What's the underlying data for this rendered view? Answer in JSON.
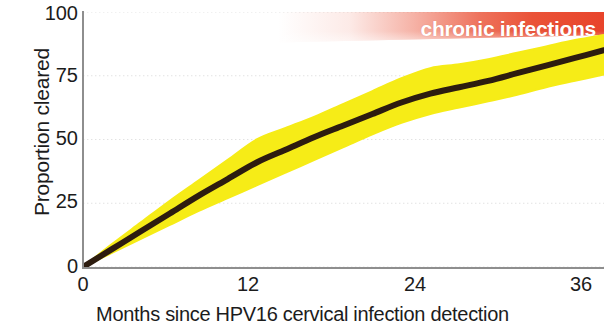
{
  "chart_data": {
    "type": "line",
    "title": "",
    "subtitle": "",
    "xlabel": "Months since HPV16 cervical infection detection",
    "ylabel": "Proportion cleared",
    "xlim": [
      0,
      36
    ],
    "ylim": [
      0,
      100
    ],
    "xticks": [
      0,
      12,
      24,
      36
    ],
    "xtick_labels": [
      "0",
      "12",
      "24",
      "36"
    ],
    "yticks": [
      0,
      25,
      50,
      75,
      100
    ],
    "ytick_labels": [
      "0",
      "25",
      "50",
      "75",
      "100"
    ],
    "grid": "horizontal-dotted",
    "legend": "none",
    "x": [
      0,
      2,
      4,
      6,
      8,
      10,
      12,
      14,
      16,
      18,
      20,
      22,
      24,
      26,
      28,
      30,
      32,
      34,
      36
    ],
    "series": [
      {
        "name": "Proportion cleared (estimate)",
        "color": "#2d1c0f",
        "values": [
          0,
          7,
          14,
          21,
          28,
          34.5,
          41,
          46,
          51,
          55.5,
          60,
          64.5,
          68,
          70.5,
          73,
          76,
          79,
          82,
          85
        ]
      },
      {
        "name": "95% confidence band upper",
        "color": "#f6ec17",
        "values": [
          0,
          9,
          17.5,
          26,
          34,
          42,
          50,
          54.5,
          59,
          64,
          69,
          74,
          78,
          79.5,
          81.5,
          84,
          86.5,
          89,
          91
        ]
      },
      {
        "name": "95% confidence band lower",
        "color": "#f6ec17",
        "values": [
          0,
          5.5,
          11,
          16.5,
          22,
          27,
          32,
          37,
          42,
          47,
          52,
          56.5,
          60,
          62.5,
          65,
          67.5,
          70.5,
          73,
          75.5
        ]
      }
    ],
    "annotations": [
      {
        "text": "chronic infections",
        "color": "#ffffff",
        "background": "#ea5338",
        "background_style": "horizontal gradient fading to transparent toward the left",
        "x_start": 20,
        "x_end": 36,
        "y_top": 100,
        "y_bottom": 88
      }
    ],
    "colors": {
      "line": "#2d1c0f",
      "band": "#f6ec17",
      "annotation_fill": "#ea5338",
      "annotation_text": "#ffffff",
      "axis": "#8e8e8e",
      "grid": "#e2e2e2",
      "text": "#1c1c1c",
      "background": "#ffffff"
    }
  },
  "axes": {
    "y_title": "Proportion cleared",
    "x_title": "Months since HPV16 cervical infection detection",
    "y_tick_labels": [
      "100",
      "75",
      "50",
      "25",
      "0"
    ],
    "x_tick_labels": [
      "0",
      "12",
      "24",
      "36"
    ]
  },
  "annotation": {
    "chronic_label": "chronic infections"
  }
}
